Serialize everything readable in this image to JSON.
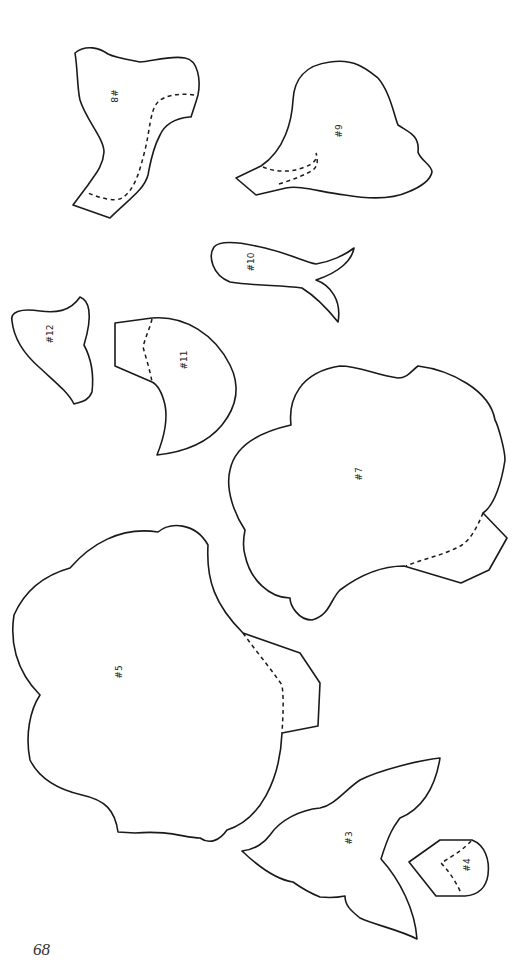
{
  "page": {
    "page_number": "68",
    "background": "#ffffff",
    "line_color": "#1a1a1a"
  },
  "pieces": [
    {
      "id": "piece-8",
      "label": "#8",
      "has_fold_line": true
    },
    {
      "id": "piece-9",
      "label": "#9",
      "has_fold_line": true
    },
    {
      "id": "piece-10",
      "label": "#10",
      "has_fold_line": false
    },
    {
      "id": "piece-12",
      "label": "#12",
      "has_fold_line": false
    },
    {
      "id": "piece-11",
      "label": "#11",
      "has_fold_line": true
    },
    {
      "id": "piece-7",
      "label": "#7",
      "has_fold_line": true
    },
    {
      "id": "piece-5",
      "label": "#5",
      "has_fold_line": true
    },
    {
      "id": "piece-3",
      "label": "#3",
      "has_fold_line": false
    },
    {
      "id": "piece-4",
      "label": "#4",
      "has_fold_line": true
    }
  ]
}
